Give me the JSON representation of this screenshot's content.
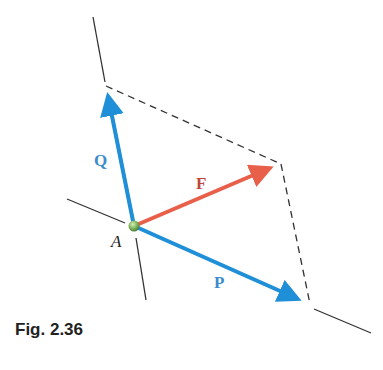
{
  "figure": {
    "caption": "Fig. 2.36",
    "point_label": "A",
    "vectors": {
      "Q": {
        "label": "Q",
        "color": "#1f8fd8"
      },
      "F": {
        "label": "F",
        "color": "#e8604a"
      },
      "P": {
        "label": "P",
        "color": "#1f8fd8"
      }
    },
    "label_colors": {
      "Q": "#3a8ccc",
      "F": "#c0463c",
      "P": "#3a8ccc",
      "A": "#222222"
    },
    "construction": "parallelogram (dashed)"
  }
}
